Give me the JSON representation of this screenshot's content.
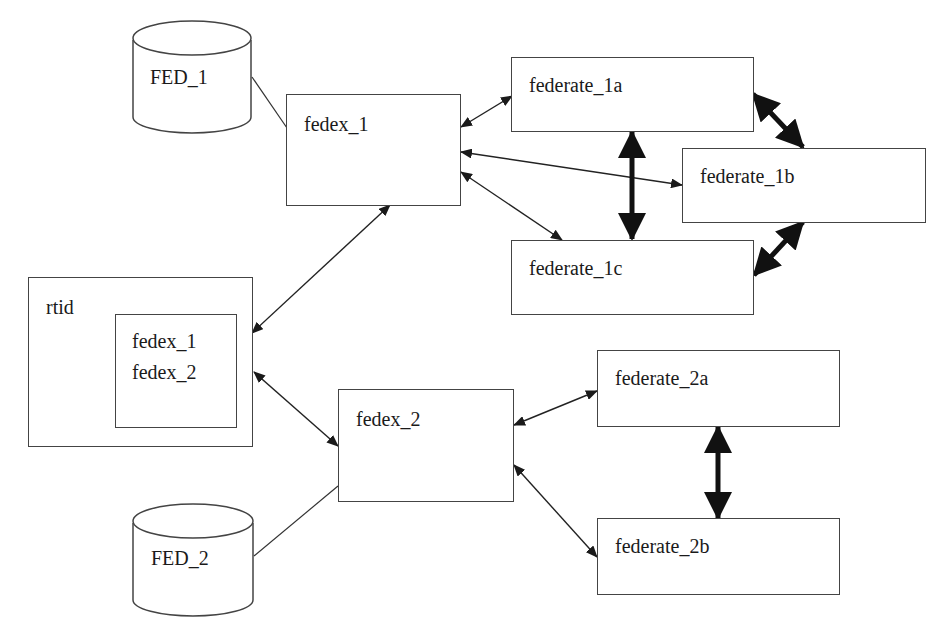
{
  "diagram": {
    "databases": [
      {
        "id": "fed1",
        "label": "FED_1"
      },
      {
        "id": "fed2",
        "label": "FED_2"
      }
    ],
    "fedex_nodes": [
      {
        "id": "fedex1",
        "label": "fedex_1"
      },
      {
        "id": "fedex2",
        "label": "fedex_2"
      }
    ],
    "rtid": {
      "label": "rtid",
      "inner_items": [
        "fedex_1",
        "fedex_2"
      ]
    },
    "federates": [
      {
        "id": "f1a",
        "label": "federate_1a"
      },
      {
        "id": "f1b",
        "label": "federate_1b"
      },
      {
        "id": "f1c",
        "label": "federate_1c"
      },
      {
        "id": "f2a",
        "label": "federate_2a"
      },
      {
        "id": "f2b",
        "label": "federate_2b"
      }
    ],
    "connections": [
      {
        "from": "FED_1",
        "to": "fedex_1",
        "type": "line"
      },
      {
        "from": "FED_2",
        "to": "fedex_2",
        "type": "line"
      },
      {
        "from": "fedex_1",
        "to": "rtid",
        "type": "bidirectional"
      },
      {
        "from": "fedex_2",
        "to": "rtid",
        "type": "bidirectional"
      },
      {
        "from": "fedex_1",
        "to": "federate_1a",
        "type": "bidirectional"
      },
      {
        "from": "fedex_1",
        "to": "federate_1b",
        "type": "bidirectional"
      },
      {
        "from": "fedex_1",
        "to": "federate_1c",
        "type": "bidirectional"
      },
      {
        "from": "fedex_2",
        "to": "federate_2a",
        "type": "bidirectional"
      },
      {
        "from": "fedex_2",
        "to": "federate_2b",
        "type": "bidirectional"
      },
      {
        "from": "federate_1a",
        "to": "federate_1c",
        "type": "bidirectional-bold"
      },
      {
        "from": "federate_1a",
        "to": "federate_1b",
        "type": "bidirectional-bold"
      },
      {
        "from": "federate_1b",
        "to": "federate_1c",
        "type": "bidirectional-bold"
      },
      {
        "from": "federate_2a",
        "to": "federate_2b",
        "type": "bidirectional-bold"
      }
    ]
  }
}
